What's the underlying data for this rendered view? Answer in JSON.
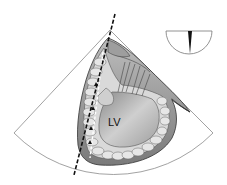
{
  "figure": {
    "type": "apical echocardiographic view illustration",
    "labels": {
      "chamber": "LV"
    },
    "colors": {
      "background": "#ffffff",
      "sector_outline": "#888888",
      "myocardium": "#9a9a9a",
      "chamber_fill": "#c8c8c8",
      "scan_line": "#111111"
    },
    "orientation_marker": {
      "shape": "half-circle with central wedge"
    }
  }
}
